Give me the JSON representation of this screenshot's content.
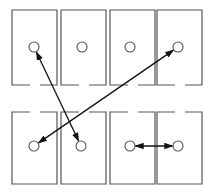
{
  "diagram": {
    "colors": {
      "line": "#555555",
      "arrow": "#111111",
      "background": "#ffffff"
    },
    "cells": [
      {
        "row": 0,
        "col": 0,
        "x": 12,
        "y": 10,
        "w": 45,
        "h": 75,
        "circle": {
          "cx": 34,
          "cy": 47
        },
        "gap_side": "bottom"
      },
      {
        "row": 0,
        "col": 1,
        "x": 61,
        "y": 10,
        "w": 45,
        "h": 75,
        "circle": {
          "cx": 82,
          "cy": 47
        },
        "gap_side": "bottom"
      },
      {
        "row": 0,
        "col": 2,
        "x": 110,
        "y": 10,
        "w": 45,
        "h": 75,
        "circle": {
          "cx": 130,
          "cy": 47
        },
        "gap_side": "bottom"
      },
      {
        "row": 0,
        "col": 3,
        "x": 157,
        "y": 10,
        "w": 45,
        "h": 75,
        "circle": {
          "cx": 178,
          "cy": 47
        },
        "gap_side": "bottom"
      },
      {
        "row": 1,
        "col": 0,
        "x": 12,
        "y": 112,
        "w": 45,
        "h": 72,
        "circle": {
          "cx": 34,
          "cy": 146
        },
        "gap_side": "top"
      },
      {
        "row": 1,
        "col": 1,
        "x": 61,
        "y": 112,
        "w": 45,
        "h": 72,
        "circle": {
          "cx": 81,
          "cy": 146
        },
        "gap_side": "top"
      },
      {
        "row": 1,
        "col": 2,
        "x": 110,
        "y": 112,
        "w": 45,
        "h": 72,
        "circle": {
          "cx": 130,
          "cy": 146
        },
        "gap_side": "top"
      },
      {
        "row": 1,
        "col": 3,
        "x": 157,
        "y": 112,
        "w": 45,
        "h": 72,
        "circle": {
          "cx": 178,
          "cy": 146
        },
        "gap_side": "top"
      }
    ],
    "arrows": [
      {
        "from": "top-1",
        "to": "bottom-2",
        "x1": 34,
        "y1": 47,
        "x2": 81,
        "y2": 146,
        "double_headed": true
      },
      {
        "from": "bottom-1",
        "to": "top-4",
        "x1": 34,
        "y1": 146,
        "x2": 178,
        "y2": 47,
        "double_headed": true
      },
      {
        "from": "bottom-3",
        "to": "bottom-4",
        "x1": 130,
        "y1": 146,
        "x2": 178,
        "y2": 146,
        "double_headed": true
      }
    ],
    "circle_radius": 5
  }
}
